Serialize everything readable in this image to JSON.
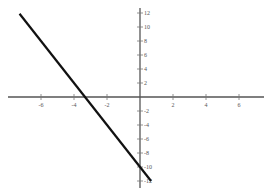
{
  "chart_data": {
    "type": "line",
    "title": "",
    "xlabel": "",
    "ylabel": "",
    "xlim": [
      -8.5,
      7.7
    ],
    "ylim": [
      -12.6,
      12.6
    ],
    "grid": false,
    "legend": null,
    "x_ticks": [
      -6,
      -4,
      -2,
      2,
      4,
      6
    ],
    "y_ticks": [
      12,
      10,
      8,
      6,
      4,
      2,
      -2,
      -4,
      -6,
      -8,
      -10,
      -12
    ],
    "series": [
      {
        "name": "y = -3x - 10",
        "x": [
          -7.3,
          0.67
        ],
        "y": [
          11.9,
          -12.0
        ],
        "color": "#111111"
      }
    ],
    "x_intercept": -3.33,
    "y_intercept": -10
  },
  "geometry": {
    "origin_px": [
      140,
      97
    ],
    "px_per_unit_x": 16.5,
    "px_per_unit_y": 7
  }
}
